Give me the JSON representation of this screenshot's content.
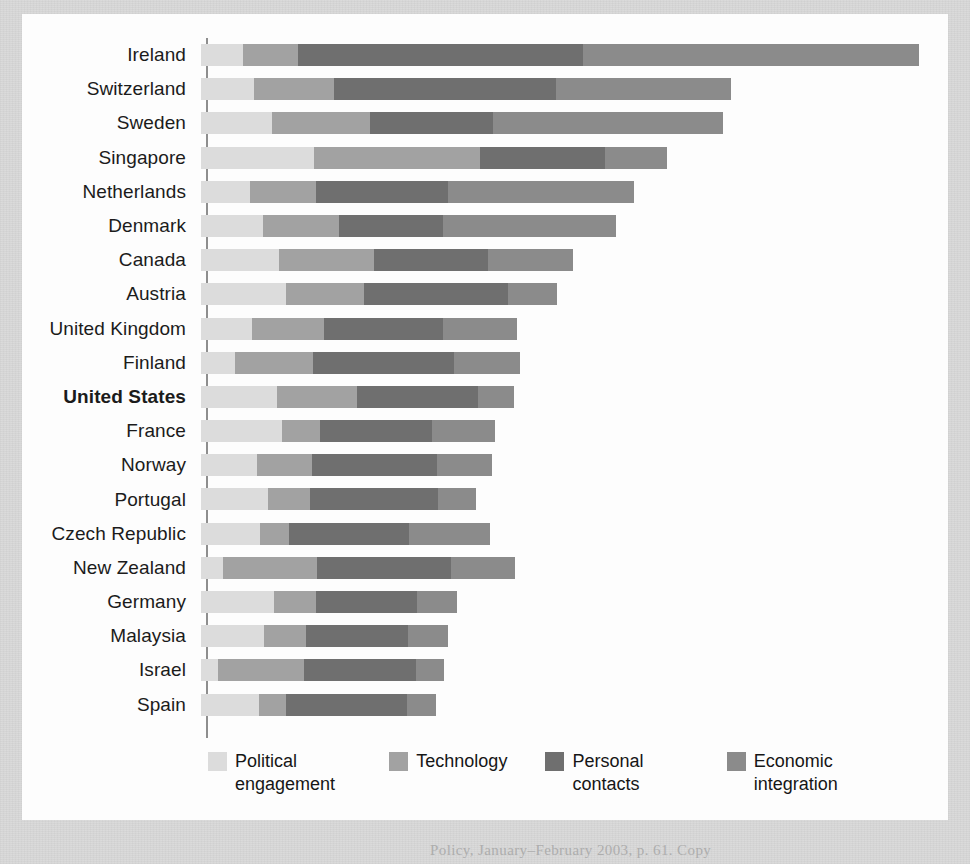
{
  "figure": {
    "caption_partial": "Policy, January–February 2003, p. 61. Copy"
  },
  "legend": {
    "items": [
      {
        "label": "Political engagement",
        "color": "#dcdcdc",
        "key": "political_engagement"
      },
      {
        "label": "Technology",
        "color": "#a2a2a2",
        "key": "technology"
      },
      {
        "label": "Personal contacts",
        "color": "#6f6f6f",
        "key": "personal_contacts"
      },
      {
        "label": "Economic integration",
        "color": "#8b8b8b",
        "key": "economic_integration"
      }
    ]
  },
  "chart_data": {
    "type": "bar",
    "orientation": "horizontal",
    "stacked": true,
    "title": "",
    "xlabel": "",
    "ylabel": "",
    "grid": false,
    "legend_position": "bottom",
    "highlighted_category": "United States",
    "series": [
      {
        "name": "Political engagement",
        "color": "#dcdcdc",
        "values": [
          42,
          53,
          71,
          113,
          49,
          62,
          78,
          85,
          51,
          34,
          76,
          81,
          56,
          67,
          59,
          22,
          73,
          63,
          17,
          58
        ]
      },
      {
        "name": "Technology",
        "color": "#a2a2a2",
        "values": [
          55,
          80,
          98,
          166,
          66,
          76,
          95,
          78,
          72,
          78,
          80,
          38,
          55,
          42,
          29,
          94,
          42,
          42,
          86,
          27
        ]
      },
      {
        "name": "Personal contacts",
        "color": "#6f6f6f",
        "values": [
          285,
          222,
          123,
          125,
          132,
          104,
          114,
          144,
          119,
          141,
          121,
          112,
          125,
          128,
          120,
          134,
          101,
          102,
          112,
          121
        ]
      },
      {
        "name": "Economic integration",
        "color": "#8b8b8b",
        "values": [
          336,
          175,
          230,
          62,
          186,
          173,
          85,
          49,
          74,
          66,
          36,
          63,
          55,
          38,
          81,
          64,
          40,
          40,
          28,
          29
        ]
      }
    ],
    "categories": [
      "Ireland",
      "Switzerland",
      "Sweden",
      "Singapore",
      "Netherlands",
      "Denmark",
      "Canada",
      "Austria",
      "United Kingdom",
      "Finland",
      "United States",
      "France",
      "Norway",
      "Portugal",
      "Czech Republic",
      "New Zealand",
      "Germany",
      "Malaysia",
      "Israel",
      "Spain"
    ]
  }
}
